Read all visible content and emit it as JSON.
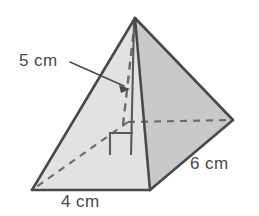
{
  "figure": {
    "name": "rectangular-pyramid",
    "colors": {
      "background": "#ffffff",
      "face_left": "#e2e2e2",
      "face_front_right": "#c9c9c9",
      "face_back_right": "#d6d6d6",
      "edge": "#4a4a4a",
      "hidden_edge": "#6b6b6b",
      "text": "#4a4a4a",
      "leader": "#4a4a4a"
    },
    "vertices": {
      "apex": [
        135,
        18
      ],
      "base_left": [
        32,
        190
      ],
      "base_front": [
        150,
        190
      ],
      "base_right": [
        233,
        120
      ],
      "base_back_hidden": [
        128,
        122
      ]
    }
  },
  "labels": {
    "slant_height": "5 cm",
    "base_width": "4 cm",
    "base_depth": "6 cm"
  },
  "annotations": {
    "leader_line": "leader-line-slant-height",
    "arrowhead": "arrowhead-slant-height",
    "right_angle_marker": "right-angle-marker",
    "altitude_line": "altitude-line",
    "hidden_edges": "dashed-hidden-edges"
  }
}
